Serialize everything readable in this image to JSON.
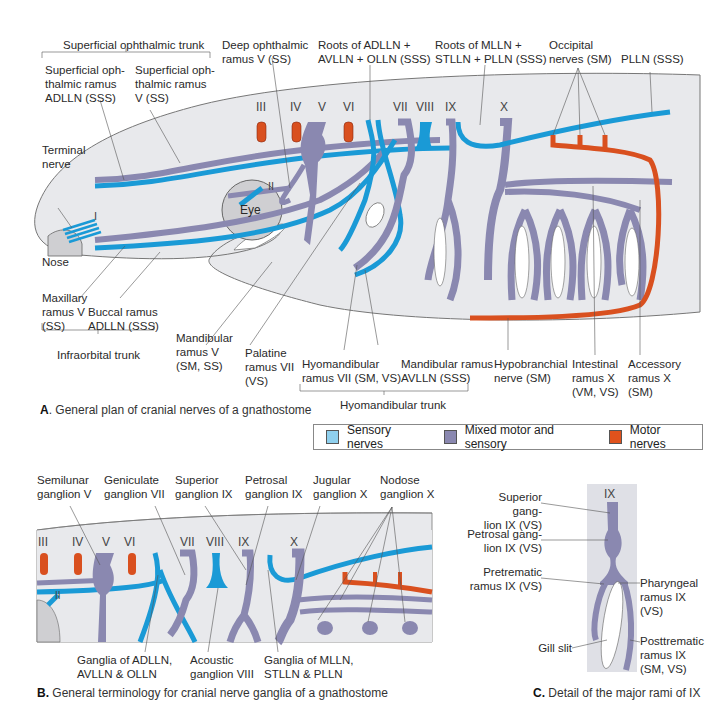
{
  "colors": {
    "sensory": "#1a9ad6",
    "mixed": "#8a88b0",
    "motor": "#d9501f",
    "body_fill": "#e8e9ec",
    "body_stroke": "#777777",
    "eye_fill": "#cfcfd2",
    "sensory_legend": "#8fd0ee",
    "mixed_legend": "#8a88b0",
    "motor_legend": "#e0521c"
  },
  "panel_a": {
    "caption_letter": "A",
    "caption_text": ". General plan of cranial nerves of a gnathostome",
    "nerve_numbers": [
      "III",
      "IV",
      "V",
      "VI",
      "VII",
      "VIII",
      "IX",
      "X",
      "II",
      "I"
    ],
    "inner_labels": {
      "eye": "Eye",
      "nose": "Nose"
    },
    "labels_top": {
      "superficial_ophthalmic_trunk": "Superficial ophthalmic trunk",
      "superficial_ophthalmic_ramus_adlln": "Superficial oph-\nthalmic ramus\nADLLN (SSS)",
      "superficial_ophthalmic_ramus_v": "Superficial oph-\nthalmic ramus\nV (SS)",
      "deep_ophthalmic_ramus_v": "Deep ophthalmic\nramus V (SS)",
      "roots_adlln_avlln_olln": "Roots of ADLLN +\nAVLLN + OLLN (SSS)",
      "roots_mlln_stlln_plln": "Roots of MLLN +\nSTLLN + PLLN (SSS)",
      "occipital_nerves": "Occipital\nnerves (SM)",
      "plln": "PLLN (SSS)",
      "terminal_nerve": "Terminal\nnerve"
    },
    "labels_bottom": {
      "maxillary_ramus_v": "Maxillary\nramus V\n(SS)",
      "buccal_ramus_adlln": "Buccal ramus\nADLLN (SSS)",
      "infraorbital_trunk": "Infraorbital trunk",
      "mandibular_ramus_v": "Mandibular\nramus V\n(SM, SS)",
      "palatine_ramus_vii": "Palatine\nramus VII\n(VS)",
      "hyomandibular_ramus_vii": "Hyomandibular\nramus VII (SM, VS)",
      "mandibular_ramus_avlln": "Mandibular ramus\nAVLLN (SSS)",
      "hyomandibular_trunk": "Hyomandibular trunk",
      "hypobranchial_nerve": "Hypobranchial\nnerve (SM)",
      "intestinal_ramus_x": "Intestinal\nramus X\n(VM, VS)",
      "accessory_ramus_x": "Accessory\nramus X\n(SM)"
    }
  },
  "legend": {
    "items": [
      {
        "label": "Sensory nerves",
        "color": "#8fd0ee"
      },
      {
        "label": "Mixed motor and sensory",
        "color": "#8a88b0"
      },
      {
        "label": "Motor nerves",
        "color": "#e0521c"
      }
    ]
  },
  "panel_b": {
    "caption_letter": "B.",
    "caption_text": " General terminology for cranial nerve ganglia of a gnathostome",
    "nerve_numbers": [
      "III",
      "IV",
      "V",
      "VI",
      "VII",
      "VIII",
      "IX",
      "X",
      "II"
    ],
    "labels_top": {
      "semilunar_ganglion_v": "Semilunar\nganglion V",
      "geniculate_ganglion_vii": "Geniculate\nganglion VII",
      "superior_ganglion_ix": "Superior\nganglion IX",
      "petrosal_ganglion_ix": "Petrosal\nganglion IX",
      "jugular_ganglion_x": "Jugular\nganglion X",
      "nodose_ganglion_x": "Nodose\nganglion X"
    },
    "labels_bottom": {
      "ganglia_adlln_avlln_olln": "Ganglia of ADLLN,\nAVLLN & OLLN",
      "acoustic_ganglion_viii": "Acoustic\nganglion VIII",
      "ganglia_mlln_stlln_plln": "Ganglia of MLLN,\nSTLLN & PLLN"
    }
  },
  "panel_c": {
    "caption_letter": "C.",
    "caption_text": " Detail of the major rami of IX",
    "nerve_number": "IX",
    "labels": {
      "superior_ganglion_ix_vs": "Superior gang-\nlion IX (VS)",
      "petrosal_ganglion_ix_vs": "Petrosal gang-\nlion IX (VS)",
      "pretrematic_ramus_ix": "Pretrematic\nramus IX (VS)",
      "gill_slit": "Gill slit",
      "pharyngeal_ramus_ix": "Pharyngeal\nramus IX (VS)",
      "posttrematic_ramus_ix": "Posttrematic\nramus IX\n(SM, VS)"
    }
  }
}
